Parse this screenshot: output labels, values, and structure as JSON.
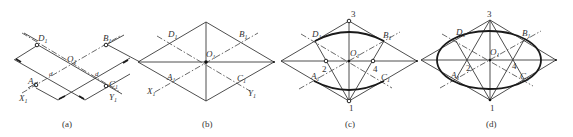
{
  "figure": {
    "panels": [
      {
        "id": "a",
        "caption": "(a)",
        "labels": {
          "D": "D",
          "B": "B",
          "O": "O",
          "A": "A",
          "C": "C",
          "X": "X",
          "Y": "Y",
          "d1": "d",
          "d2": "d",
          "sub": "1"
        }
      },
      {
        "id": "b",
        "caption": "(b)",
        "labels": {
          "D": "D",
          "B": "B",
          "O": "O",
          "A": "A",
          "C": "C",
          "X": "X",
          "Y": "Y",
          "sub": "1"
        }
      },
      {
        "id": "c",
        "caption": "(c)",
        "labels": {
          "D": "D",
          "B": "B",
          "O": "O",
          "A": "A",
          "C": "C",
          "n1": "1",
          "n2": "2",
          "n3": "3",
          "n4": "4",
          "sub": "1"
        }
      },
      {
        "id": "d",
        "caption": "(d)",
        "labels": {
          "D": "D",
          "B": "B",
          "O": "O",
          "A": "A",
          "C": "C",
          "n1": "1",
          "n2": "2",
          "n3": "3",
          "n4": "4",
          "sub": "1"
        }
      }
    ],
    "colors": {
      "line": "#3a3a3a",
      "background": "#ffffff"
    }
  }
}
